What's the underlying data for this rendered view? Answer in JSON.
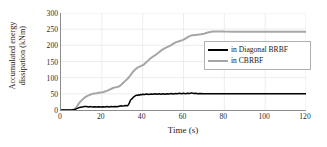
{
  "chart_data": {
    "type": "line",
    "title": "",
    "xlabel": "Time (s)",
    "ylabel": "Accumulated energy dissipation (kNm)",
    "ylabel_line1": "Accumulated energy",
    "ylabel_line2": "dissipation (kNm)",
    "xlim": [
      0,
      120
    ],
    "ylim": [
      0,
      300
    ],
    "xticks": [
      0,
      20,
      40,
      60,
      80,
      100,
      120
    ],
    "yticks": [
      0,
      50,
      100,
      150,
      200,
      250,
      300
    ],
    "grid": "horizontal-and-vertical-faint",
    "legend_position": "center-right",
    "colors": {
      "diagonal_brbf": "#000000",
      "cbrbf": "#a6a6a6",
      "axis": "#8c8c8c",
      "grid": "#e8e8e8",
      "background": "#ffffff"
    },
    "series": [
      {
        "name": "in Diagonal BRBF",
        "color": "#000000",
        "final_value": 50,
        "points": [
          [
            0,
            0
          ],
          [
            2,
            0
          ],
          [
            4,
            0
          ],
          [
            5.5,
            0.3
          ],
          [
            6.5,
            1.2
          ],
          [
            7.5,
            3.5
          ],
          [
            8.5,
            6.5
          ],
          [
            9.5,
            8.5
          ],
          [
            10.5,
            9.5
          ],
          [
            11.5,
            10.5
          ],
          [
            12.5,
            11.0
          ],
          [
            13.5,
            9.5
          ],
          [
            14.5,
            10.5
          ],
          [
            15.5,
            9.0
          ],
          [
            16.5,
            10.0
          ],
          [
            17.5,
            9.0
          ],
          [
            18.5,
            10.0
          ],
          [
            19.5,
            9.0
          ],
          [
            20.5,
            10.0
          ],
          [
            21.5,
            9.5
          ],
          [
            22.5,
            10.5
          ],
          [
            23.5,
            9.5
          ],
          [
            24.5,
            10.5
          ],
          [
            25.5,
            10.0
          ],
          [
            26.5,
            11.0
          ],
          [
            27.5,
            10.0
          ],
          [
            28.5,
            11.5
          ],
          [
            29.5,
            13.0
          ],
          [
            30.5,
            12.0
          ],
          [
            31.5,
            14.0
          ],
          [
            32.5,
            13.0
          ],
          [
            33.0,
            16.0
          ],
          [
            33.5,
            22.0
          ],
          [
            34.0,
            30.0
          ],
          [
            34.5,
            33.0
          ],
          [
            35.0,
            36.0
          ],
          [
            35.5,
            40.0
          ],
          [
            36.0,
            42.0
          ],
          [
            36.5,
            44.5
          ],
          [
            37.0,
            46.0
          ],
          [
            37.5,
            45.0
          ],
          [
            38.0,
            47.0
          ],
          [
            38.5,
            46.0
          ],
          [
            39.0,
            48.0
          ],
          [
            39.5,
            47.0
          ],
          [
            40.0,
            49.0
          ],
          [
            41.0,
            48.0
          ],
          [
            42.0,
            49.5
          ],
          [
            43.0,
            48.0
          ],
          [
            44.0,
            49.5
          ],
          [
            45.0,
            48.5
          ],
          [
            46.0,
            50.0
          ],
          [
            47.0,
            48.5
          ],
          [
            48.0,
            50.0
          ],
          [
            49.0,
            49.0
          ],
          [
            50.0,
            50.5
          ],
          [
            51.0,
            49.0
          ],
          [
            52.0,
            50.5
          ],
          [
            53.0,
            49.5
          ],
          [
            54.0,
            51.0
          ],
          [
            55.0,
            49.5
          ],
          [
            56.0,
            51.0
          ],
          [
            57.0,
            50.0
          ],
          [
            58.0,
            51.5
          ],
          [
            59.0,
            50.0
          ],
          [
            60.0,
            51.5
          ],
          [
            61.0,
            50.5
          ],
          [
            62.0,
            52.0
          ],
          [
            63.0,
            51.0
          ],
          [
            64.0,
            53.0
          ],
          [
            65.0,
            51.0
          ],
          [
            66.0,
            52.0
          ],
          [
            67.0,
            50.5
          ],
          [
            68.0,
            51.0
          ],
          [
            70.0,
            50.5
          ],
          [
            72.0,
            50.5
          ],
          [
            75.0,
            50.0
          ],
          [
            80.0,
            50.0
          ],
          [
            90.0,
            50.0
          ],
          [
            100.0,
            50.0
          ],
          [
            110.0,
            50.0
          ],
          [
            120.0,
            50.0
          ]
        ]
      },
      {
        "name": "in CBRBF",
        "color": "#a6a6a6",
        "final_value": 242,
        "points": [
          [
            0,
            0
          ],
          [
            2,
            0
          ],
          [
            4,
            0
          ],
          [
            5.5,
            0.5
          ],
          [
            6.5,
            2.0
          ],
          [
            7.5,
            8.0
          ],
          [
            8.5,
            18.0
          ],
          [
            9.5,
            26.0
          ],
          [
            10.5,
            32.0
          ],
          [
            11.5,
            38.0
          ],
          [
            12.5,
            42.0
          ],
          [
            13.5,
            45.0
          ],
          [
            14.5,
            48.0
          ],
          [
            15.5,
            50.0
          ],
          [
            16.5,
            51.0
          ],
          [
            17.5,
            52.0
          ],
          [
            18.5,
            53.0
          ],
          [
            19.5,
            54.0
          ],
          [
            20.5,
            55.0
          ],
          [
            21.5,
            57.0
          ],
          [
            22.5,
            59.0
          ],
          [
            23.5,
            62.0
          ],
          [
            24.5,
            65.0
          ],
          [
            25.5,
            68.0
          ],
          [
            26.5,
            70.0
          ],
          [
            27.5,
            71.0
          ],
          [
            28.5,
            73.0
          ],
          [
            29.5,
            78.0
          ],
          [
            30.5,
            84.0
          ],
          [
            31.5,
            90.0
          ],
          [
            32.5,
            96.0
          ],
          [
            33.5,
            103.0
          ],
          [
            34.5,
            112.0
          ],
          [
            35.5,
            120.0
          ],
          [
            36.5,
            126.0
          ],
          [
            37.5,
            131.0
          ],
          [
            38.5,
            134.0
          ],
          [
            39.5,
            137.0
          ],
          [
            40.5,
            140.0
          ],
          [
            41.5,
            146.0
          ],
          [
            42.5,
            152.0
          ],
          [
            43.5,
            158.0
          ],
          [
            44.5,
            163.0
          ],
          [
            45.5,
            167.0
          ],
          [
            46.5,
            171.0
          ],
          [
            47.5,
            176.0
          ],
          [
            48.5,
            181.0
          ],
          [
            49.5,
            186.0
          ],
          [
            50.5,
            190.0
          ],
          [
            51.5,
            193.0
          ],
          [
            52.5,
            196.0
          ],
          [
            53.5,
            199.0
          ],
          [
            54.5,
            203.0
          ],
          [
            55.5,
            207.0
          ],
          [
            56.5,
            210.0
          ],
          [
            57.5,
            212.0
          ],
          [
            58.5,
            214.0
          ],
          [
            59.5,
            216.0
          ],
          [
            60.5,
            219.0
          ],
          [
            61.5,
            223.0
          ],
          [
            62.5,
            227.0
          ],
          [
            63.5,
            230.0
          ],
          [
            64.5,
            231.0
          ],
          [
            65.5,
            232.0
          ],
          [
            67.0,
            233.0
          ],
          [
            68.5,
            234.0
          ],
          [
            70.0,
            236.0
          ],
          [
            71.5,
            239.0
          ],
          [
            73.0,
            241.0
          ],
          [
            74.5,
            242.5
          ],
          [
            76.0,
            243.0
          ],
          [
            78.0,
            243.0
          ],
          [
            80.0,
            242.5
          ],
          [
            85.0,
            242.0
          ],
          [
            90.0,
            242.0
          ],
          [
            95.0,
            242.0
          ],
          [
            100.0,
            242.0
          ],
          [
            110.0,
            242.0
          ],
          [
            120.0,
            242.0
          ]
        ]
      }
    ]
  },
  "legend": {
    "items": [
      {
        "label": "in Diagonal BRBF",
        "style": "black"
      },
      {
        "label": "in CBRBF",
        "style": "gray"
      }
    ]
  }
}
